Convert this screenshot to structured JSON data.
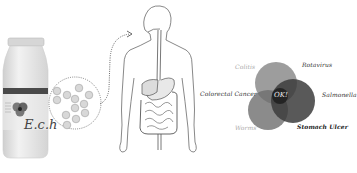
{
  "figure": {
    "bottle": {
      "brand_text": "E.c.h",
      "cap_color": "#d8d8d8",
      "body_color": "#e6e6e6",
      "label_band_color": "#4a4a4a",
      "logo_colors": [
        "#6a6a6a",
        "#4d4d4d",
        "#333333"
      ]
    },
    "magnifier": {
      "bacteria_count": 12,
      "fill": "#d6d6d6",
      "stroke": "#9a9a9a"
    },
    "venn": {
      "center_label": "OK!",
      "circles": [
        {
          "name": "top-left",
          "color": "#8c8c8c"
        },
        {
          "name": "right",
          "color": "#3c3c3c"
        },
        {
          "name": "bottom-left",
          "color": "#6e6e6e"
        }
      ],
      "labels": {
        "colitis": "Colitis",
        "rotavirus": "Rotavirus",
        "colorectal_cancer": "Colorectal Cancer",
        "salmonella": "Salmonella",
        "worms": "Worms",
        "stomach_ulcer": "Stomach Ulcer"
      }
    }
  }
}
